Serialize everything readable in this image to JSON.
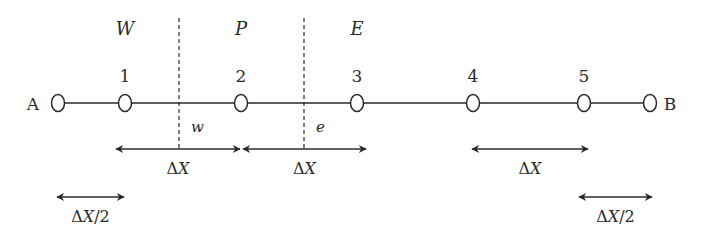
{
  "diagram": {
    "type": "1d-grid-finite-volume",
    "colors": {
      "stroke": "#2a2a2a",
      "background": "#ffffff"
    },
    "boundaries": {
      "left": {
        "label": "A",
        "x": 58
      },
      "right": {
        "label": "B",
        "x": 650
      }
    },
    "nodes": [
      {
        "label": "1",
        "x": 125
      },
      {
        "label": "2",
        "x": 241
      },
      {
        "label": "3",
        "x": 357
      },
      {
        "label": "4",
        "x": 473
      },
      {
        "label": "5",
        "x": 584
      }
    ],
    "region_labels": [
      {
        "label": "W",
        "x": 125
      },
      {
        "label": "P",
        "x": 241
      },
      {
        "label": "E",
        "x": 357
      }
    ],
    "faces": [
      {
        "label": "w",
        "x": 179
      },
      {
        "label": "e",
        "x": 304
      }
    ],
    "spacing_arrows": [
      {
        "label": "ΔX",
        "x1": 116,
        "x2": 240,
        "y": 149
      },
      {
        "label": "ΔX",
        "x1": 243,
        "x2": 366,
        "y": 149
      },
      {
        "label": "ΔX",
        "x1": 472,
        "x2": 588,
        "y": 149
      },
      {
        "label": "ΔX/2",
        "x1": 57,
        "x2": 124,
        "y": 197
      },
      {
        "label": "ΔX/2",
        "x1": 579,
        "x2": 652,
        "y": 197
      }
    ]
  }
}
